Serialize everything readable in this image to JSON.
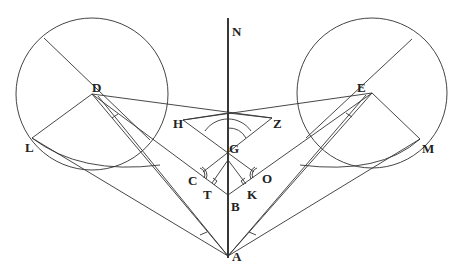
{
  "diagram": {
    "labels": {
      "N": "N",
      "D": "D",
      "E": "E",
      "H": "H",
      "Z": "Z",
      "G": "G",
      "C": "C",
      "O": "O",
      "T": "T",
      "K": "K",
      "B": "B",
      "A": "A",
      "L": "L",
      "M": "M"
    },
    "colors": {
      "stroke": "#333333",
      "background": "#ffffff"
    }
  }
}
